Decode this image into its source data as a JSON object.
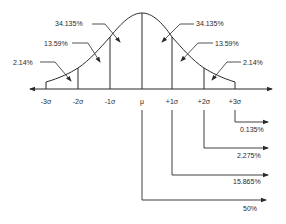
{
  "diagram": {
    "title": "",
    "colors": {
      "ink": "#2a2a2a",
      "background": "#ffffff"
    },
    "axis_labels": [
      "-3σ",
      "-2σ",
      "-1σ",
      "μ",
      "+1σ",
      "+2σ",
      "+3σ"
    ],
    "area_labels": {
      "left_inner": "34.135%",
      "left_middle": "13.59%",
      "left_outer": "2.14%",
      "right_inner": "34.135%",
      "right_middle": "13.59%",
      "right_outer": "2.14%"
    },
    "cumulative_labels": {
      "plus3": "0.135%",
      "plus2": "2.275%",
      "plus1": "15.865%",
      "mean": "50%"
    }
  }
}
